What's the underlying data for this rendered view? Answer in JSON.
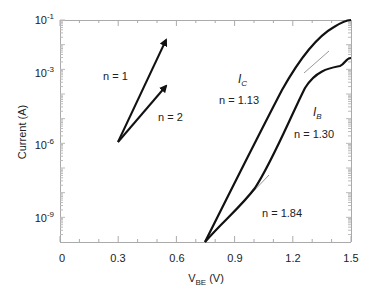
{
  "chart_data": {
    "type": "line",
    "title": "",
    "xlabel": "V_BE (V)",
    "xlabel_main": "V",
    "xlabel_sub": "BE",
    "xlabel_unit": " (V)",
    "ylabel": "Current (A)",
    "xlim": [
      0,
      1.5
    ],
    "ylim_log10": [
      -10,
      -1
    ],
    "y_scale": "log",
    "grid": false,
    "x_ticks": [
      "0",
      "0.3",
      "0.6",
      "0.9",
      "1.2",
      "1.5"
    ],
    "y_ticks": [
      {
        "base": "10",
        "exp": "-1",
        "value": 0.1
      },
      {
        "base": "10",
        "exp": "-3",
        "value": 0.001
      },
      {
        "base": "10",
        "exp": "-6",
        "value": 1e-06
      },
      {
        "base": "10",
        "exp": "-9",
        "value": 1e-09
      }
    ],
    "series": [
      {
        "name": "I_C",
        "label_main": "I",
        "label_sub": "C",
        "ideality": "n = 1.13",
        "x": [
          0.74,
          0.8,
          0.9,
          1.0,
          1.1,
          1.2,
          1.3,
          1.4,
          1.45,
          1.5
        ],
        "log10_y": [
          -10,
          -8.9,
          -7.2,
          -5.5,
          -3.9,
          -2.6,
          -1.7,
          -1.2,
          -1.05,
          -1.0
        ]
      },
      {
        "name": "I_B",
        "label_main": "I",
        "label_sub": "B",
        "ideality": "n = 1.30",
        "ideality_low": "n = 1.84",
        "x": [
          0.74,
          0.8,
          0.9,
          1.0,
          1.1,
          1.2,
          1.3,
          1.4,
          1.45,
          1.48,
          1.5
        ],
        "log10_y": [
          -10,
          -9.3,
          -8.4,
          -7.2,
          -5.8,
          -4.5,
          -3.5,
          -2.9,
          -2.7,
          -2.45,
          -2.45
        ]
      }
    ],
    "annotations": [
      {
        "text": "n = 1",
        "type": "reference-slope-arrow"
      },
      {
        "text": "n = 2",
        "type": "reference-slope-arrow"
      },
      {
        "text": "n = 1.13"
      },
      {
        "text": "n = 1.30"
      },
      {
        "text": "n = 1.84"
      }
    ]
  },
  "labels": {
    "n1": "n = 1",
    "n2": "n = 2",
    "ic_main": "I",
    "ic_sub": "C",
    "ic_n": "n = 1.13",
    "ib_main": "I",
    "ib_sub": "B",
    "ib_n": "n = 1.30",
    "ib_low_n": "n = 1.84",
    "ylabel": "Current (A)",
    "x_main": "V",
    "x_sub": "BE",
    "x_unit": " (V)"
  }
}
